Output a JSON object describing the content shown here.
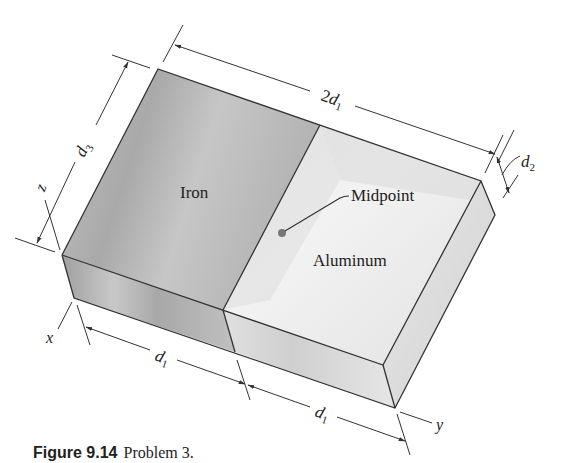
{
  "figure": {
    "caption_number": "Figure 9.14",
    "caption_text": "Problem 3."
  },
  "labels": {
    "iron": "Iron",
    "aluminum": "Aluminum",
    "midpoint": "Midpoint"
  },
  "dimensions": {
    "length_total": {
      "coef": "2",
      "var": "d",
      "sub": "1"
    },
    "height": {
      "var": "d",
      "sub": "3"
    },
    "thickness": {
      "var": "d",
      "sub": "2"
    },
    "half_left": {
      "var": "d",
      "sub": "1"
    },
    "half_right": {
      "var": "d",
      "sub": "1"
    }
  },
  "axes": {
    "x": "x",
    "y": "y",
    "z": "z"
  },
  "colors": {
    "iron_face": "#b9b9b9",
    "aluminum_face": "#e6e6e6",
    "edge": "#333333",
    "midpoint_dot": "#777777"
  }
}
